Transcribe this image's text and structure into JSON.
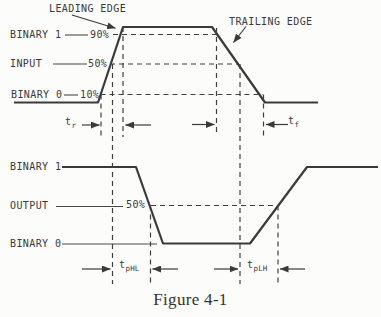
{
  "figure": {
    "caption": "Figure 4-1",
    "colors": {
      "ink": "#3a3a3a",
      "paper": "#fcfcfa"
    },
    "input": {
      "leading_edge": "LEADING EDGE",
      "trailing_edge": "TRAILING EDGE",
      "binary1": "BINARY 1",
      "pct90": "90%",
      "name": "INPUT",
      "pct50": "50%",
      "binary0": "BINARY 0",
      "pct10": "10%",
      "t_rise": {
        "base": "t",
        "sub": "r"
      },
      "t_fall": {
        "base": "t",
        "sub": "f"
      }
    },
    "output": {
      "binary1": "BINARY 1",
      "name": "OUTPUT",
      "pct50": "50%",
      "binary0": "BINARY 0",
      "t_phl": {
        "base": "t",
        "sub": "pHL"
      },
      "t_plh": {
        "base": "t",
        "sub": "pLH"
      }
    }
  }
}
